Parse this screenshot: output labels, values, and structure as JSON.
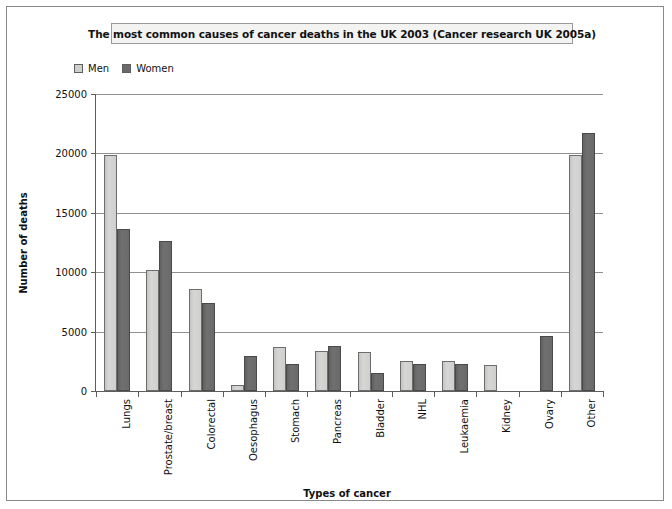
{
  "chart": {
    "title": "The most common causes of cancer deaths in the UK 2003 (Cancer research UK 2005a)",
    "xlabel": "Types of cancer",
    "ylabel": "Number of deaths"
  },
  "legend": {
    "items": [
      {
        "label": "Men",
        "color": "#cfcfcd"
      },
      {
        "label": "Women",
        "color": "#6a6a6a"
      }
    ]
  },
  "chart_data": {
    "type": "bar",
    "title": "The most common causes of cancer deaths in the UK 2003 (Cancer research UK 2005a)",
    "xlabel": "Types of cancer",
    "ylabel": "Number of deaths",
    "ylim": [
      0,
      25000
    ],
    "ytick_labels": [
      "0",
      "5000",
      "10000",
      "15000",
      "20000",
      "25000"
    ],
    "ytick_values": [
      0,
      5000,
      10000,
      15000,
      20000,
      25000
    ],
    "grid": true,
    "legend_position": "top-left",
    "categories": [
      "Lungs",
      "Prostate/breast",
      "Colorectal",
      "Oesophagus",
      "Stomach",
      "Pancreas",
      "Bladder",
      "NHL",
      "Leukaemia",
      "Kidney",
      "Ovary",
      "Other"
    ],
    "series": [
      {
        "name": "Men",
        "color": "#cfcfcd",
        "values": [
          19850,
          10200,
          8550,
          500,
          3700,
          3400,
          3250,
          2500,
          2500,
          2200,
          0,
          19850
        ]
      },
      {
        "name": "Women",
        "color": "#6a6a6a",
        "values": [
          13600,
          12650,
          7400,
          2950,
          2250,
          3750,
          1500,
          2300,
          2300,
          0,
          4600,
          21750
        ]
      }
    ]
  }
}
